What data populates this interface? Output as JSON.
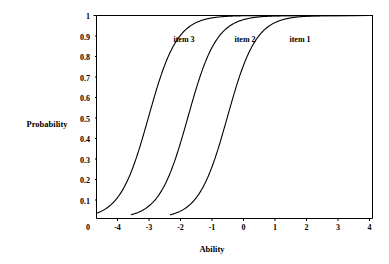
{
  "chart_data": {
    "type": "line",
    "title": "",
    "xlabel": "Ability",
    "ylabel": "Probability",
    "xlim": [
      -4.65,
      4.1
    ],
    "ylim": [
      0,
      1
    ],
    "grid": false,
    "legend_position": "inline-annotations",
    "x_ticks": [
      -4,
      -3,
      -2,
      -1,
      0,
      1,
      2,
      3,
      4
    ],
    "x_tick_labels": [
      "-4",
      "-3",
      "-2",
      "-1",
      "0",
      "1",
      "2",
      "3",
      "4"
    ],
    "y_ticks": [
      0,
      0.1,
      0.2,
      0.3,
      0.4,
      0.5,
      0.6,
      0.7,
      0.8,
      0.9,
      1
    ],
    "y_tick_labels": [
      "0",
      "0.1",
      "0.2",
      "0.3",
      "0.4",
      "0.5",
      "0.6",
      "0.7",
      "0.8",
      "0.9",
      "1"
    ],
    "origin_label": "0",
    "series": [
      {
        "name": "item 3",
        "annotation": "item 3",
        "model": "logistic",
        "difficulty": -3.0,
        "discrimination": 2.2,
        "points_x": [
          -4.4,
          -4.2,
          -4.0,
          -3.8,
          -3.6,
          -3.4,
          -3.2,
          -3.0,
          -2.8,
          -2.6,
          -2.4,
          -2.2,
          -2.0,
          -1.8,
          -1.6,
          -1.4,
          -1.2,
          -1.0
        ],
        "points_y": [
          0.041,
          0.062,
          0.094,
          0.139,
          0.201,
          0.283,
          0.381,
          0.5,
          0.619,
          0.717,
          0.799,
          0.861,
          0.906,
          0.938,
          0.96,
          0.974,
          0.983,
          0.989
        ]
      },
      {
        "name": "item 2",
        "annotation": "item 2",
        "model": "logistic",
        "difficulty": -1.75,
        "discrimination": 2.2,
        "points_x": [
          -3.2,
          -3.0,
          -2.8,
          -2.6,
          -2.4,
          -2.2,
          -2.0,
          -1.75,
          -1.5,
          -1.3,
          -1.1,
          -0.9,
          -0.7,
          -0.5,
          -0.3,
          -0.1,
          0.2,
          0.5
        ],
        "points_y": [
          0.045,
          0.068,
          0.102,
          0.151,
          0.217,
          0.303,
          0.406,
          0.5,
          0.631,
          0.718,
          0.791,
          0.848,
          0.892,
          0.925,
          0.949,
          0.965,
          0.981,
          0.99
        ]
      },
      {
        "name": "item 1",
        "annotation": "item 1",
        "model": "logistic",
        "difficulty": -0.5,
        "discrimination": 2.2,
        "points_x": [
          -2.0,
          -1.8,
          -1.6,
          -1.4,
          -1.2,
          -1.0,
          -0.8,
          -0.5,
          -0.3,
          0.0,
          0.2,
          0.4,
          0.6,
          0.9,
          1.2,
          1.5,
          1.8,
          2.0
        ],
        "points_y": [
          0.038,
          0.058,
          0.088,
          0.131,
          0.19,
          0.269,
          0.366,
          0.5,
          0.598,
          0.746,
          0.824,
          0.882,
          0.923,
          0.963,
          0.983,
          0.992,
          0.996,
          0.998
        ]
      }
    ]
  },
  "annotations": {
    "item3_label": "item 3",
    "item2_label": "item 2",
    "item1_label": "item 1"
  },
  "axes": {
    "y_title": "Probability",
    "x_title": "Ability",
    "origin": "0"
  }
}
